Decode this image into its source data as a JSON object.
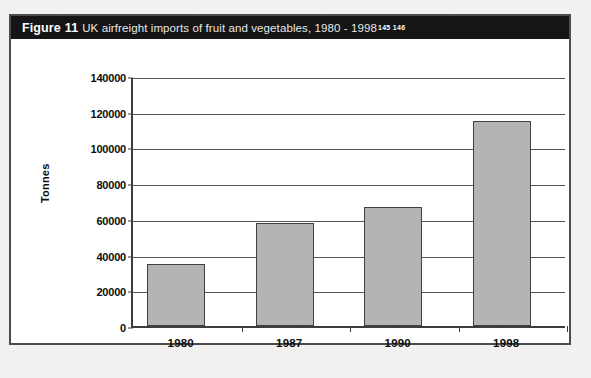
{
  "figure": {
    "label": "Figure",
    "number": "11",
    "caption": "UK airfreight imports of fruit and vegetables, 1980 - 1998",
    "superscripts": "145 146",
    "frame_color": "#4c4c4c",
    "caption_bar_color": "#151515"
  },
  "chart_data": {
    "type": "bar",
    "title": "UK airfreight imports of fruit and vegetables, 1980 - 1998",
    "categories": [
      "1980",
      "1987",
      "1990",
      "1998"
    ],
    "values": [
      35000,
      57500,
      66500,
      115000
    ],
    "series": [
      {
        "name": "UK airfreight imports of fruit and vegetables",
        "values": [
          35000,
          57500,
          66500,
          115000
        ]
      }
    ],
    "xlabel": "",
    "ylabel": "Tonnes",
    "ylim": [
      0,
      140000
    ],
    "ytick_step": 20000,
    "yticks": [
      0,
      20000,
      40000,
      60000,
      80000,
      100000,
      120000,
      140000
    ],
    "ytick_labels": [
      "0",
      "20000",
      "40000",
      "60000",
      "80000",
      "100000",
      "120000",
      "140000"
    ],
    "grid": true,
    "grid_axis": "y",
    "legend": false,
    "legend_position": "none",
    "bar_color": "#b4b4b4",
    "bar_edge_color": "#404040",
    "units": "Tonnes"
  }
}
